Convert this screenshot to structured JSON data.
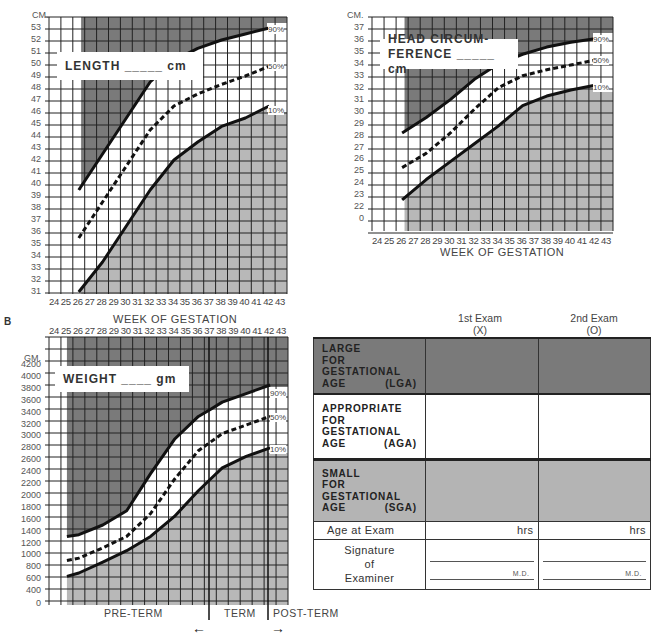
{
  "section_labels": {
    "b": "B"
  },
  "length_chart": {
    "unit_label": "CM.",
    "title_box": "LENGTH _____ cm",
    "xlabel": "WEEK OF GESTATION",
    "y_ticks": [
      "53",
      "52",
      "51",
      "50",
      "49",
      "48",
      "47",
      "46",
      "45",
      "44",
      "43",
      "42",
      "41",
      "40",
      "39",
      "38",
      "37",
      "36",
      "35",
      "34",
      "33",
      "32",
      "31"
    ],
    "x_ticks": [
      "24",
      "25",
      "26",
      "27",
      "28",
      "29",
      "30",
      "31",
      "32",
      "33",
      "34",
      "35",
      "36",
      "37",
      "38",
      "39",
      "40",
      "41",
      "42",
      "43"
    ],
    "percentiles": [
      "90%",
      "50%",
      "10%"
    ]
  },
  "head_chart": {
    "unit_label": "CM.",
    "title_line1": "HEAD CIRCUM-",
    "title_line2": "FERENCE _____ cm",
    "xlabel": "WEEK OF GESTATION",
    "y_ticks": [
      "37",
      "36",
      "35",
      "34",
      "33",
      "32",
      "31",
      "30",
      "29",
      "28",
      "27",
      "26",
      "25",
      "24",
      "23",
      "22",
      "0"
    ],
    "x_ticks": [
      "24",
      "25",
      "26",
      "27",
      "28",
      "29",
      "30",
      "31",
      "32",
      "33",
      "34",
      "35",
      "36",
      "37",
      "38",
      "39",
      "40",
      "41",
      "42",
      "43"
    ],
    "percentiles": [
      "90%",
      "50%",
      "10%"
    ]
  },
  "weight_chart": {
    "unit_label": "GM.",
    "title_box": "WEIGHT ____ gm",
    "x_ticks": [
      "24",
      "25",
      "26",
      "27",
      "28",
      "29",
      "30",
      "31",
      "32",
      "33",
      "34",
      "35",
      "36",
      "37",
      "38",
      "39",
      "40",
      "41",
      "42",
      "43"
    ],
    "y_ticks": [
      "4200",
      "4000",
      "3800",
      "3600",
      "3400",
      "3200",
      "3000",
      "2800",
      "2600",
      "2400",
      "2200",
      "2000",
      "1800",
      "1600",
      "1400",
      "1200",
      "1000",
      "800",
      "600",
      "400",
      "0"
    ],
    "percentiles": [
      "90%",
      "50%",
      "10%"
    ],
    "periods": {
      "pre_term": "PRE-TERM",
      "term": "TERM",
      "post_term": "POST-TERM"
    },
    "arrows": {
      "left": "←",
      "right": "→"
    }
  },
  "classification_table": {
    "col_headers": [
      {
        "line1": "1st Exam",
        "line2": "(X)"
      },
      {
        "line1": "2nd Exam",
        "line2": "(O)"
      }
    ],
    "rows": [
      {
        "lines": [
          "LARGE",
          "FOR",
          "GESTATIONAL"
        ],
        "last": "AGE",
        "abbr": "(LGA)",
        "color": "#7a7a7a"
      },
      {
        "lines": [
          "APPROPRIATE",
          "FOR",
          "GESTATIONAL"
        ],
        "last": "AGE",
        "abbr": "(AGA)",
        "color": "#ffffff"
      },
      {
        "lines": [
          "SMALL",
          "FOR",
          "GESTATIONAL"
        ],
        "last": "AGE",
        "abbr": "(SGA)",
        "color": "#b4b4b4"
      }
    ],
    "age_row": {
      "label": "Age at Exam",
      "unit1": "hrs",
      "unit2": "hrs"
    },
    "signature_row": {
      "label_line1": "Signature",
      "label_line2": "of",
      "label_line3": "Examiner",
      "suffix1": "M.D.",
      "suffix2": "M.D."
    }
  },
  "chart_data": [
    {
      "type": "line",
      "title": "LENGTH cm",
      "xlabel": "WEEK OF GESTATION",
      "ylabel": "CM.",
      "xlim": [
        24,
        43
      ],
      "ylim": [
        31,
        53
      ],
      "grid": true,
      "x": [
        26,
        28,
        30,
        32,
        34,
        36,
        38,
        40,
        42
      ],
      "series": [
        {
          "name": "90%",
          "values": [
            39.5,
            42.5,
            45.5,
            48.5,
            50.3,
            51.3,
            52.0,
            52.5,
            53.0
          ]
        },
        {
          "name": "50%",
          "values": [
            35.5,
            38.5,
            41.5,
            44.5,
            46.5,
            47.5,
            48.3,
            49.0,
            49.8
          ]
        },
        {
          "name": "10%",
          "values": [
            31.0,
            33.5,
            36.5,
            39.5,
            42.0,
            43.5,
            44.8,
            45.5,
            46.5
          ]
        }
      ]
    },
    {
      "type": "line",
      "title": "HEAD CIRCUMFERENCE cm",
      "xlabel": "WEEK OF GESTATION",
      "ylabel": "CM.",
      "xlim": [
        24,
        43
      ],
      "ylim": [
        22,
        37
      ],
      "grid": true,
      "x": [
        26,
        28,
        30,
        32,
        34,
        36,
        38,
        40,
        42
      ],
      "series": [
        {
          "name": "90%",
          "values": [
            28.2,
            29.5,
            31.0,
            32.7,
            34.0,
            34.8,
            35.4,
            35.8,
            36.1
          ]
        },
        {
          "name": "50%",
          "values": [
            25.3,
            26.5,
            28.2,
            30.2,
            32.0,
            33.0,
            33.5,
            33.9,
            34.3
          ]
        },
        {
          "name": "10%",
          "values": [
            22.6,
            24.3,
            25.8,
            27.3,
            28.8,
            30.5,
            31.3,
            31.8,
            32.2
          ]
        }
      ]
    },
    {
      "type": "line",
      "title": "WEIGHT gm",
      "xlabel": "WEEK OF GESTATION",
      "ylabel": "GM.",
      "xlim": [
        24,
        43
      ],
      "ylim": [
        0,
        4200
      ],
      "grid": true,
      "annotations": [
        "PRE-TERM",
        "TERM",
        "POST-TERM"
      ],
      "x": [
        25,
        26,
        28,
        30,
        32,
        34,
        36,
        37,
        38,
        40,
        42
      ],
      "series": [
        {
          "name": "90%",
          "values": [
            1200,
            1230,
            1400,
            1650,
            2300,
            2900,
            3300,
            3420,
            3550,
            3700,
            3850
          ]
        },
        {
          "name": "50%",
          "values": [
            780,
            820,
            1000,
            1200,
            1600,
            2200,
            2700,
            2850,
            3000,
            3150,
            3300
          ]
        },
        {
          "name": "10%",
          "values": [
            500,
            560,
            750,
            950,
            1200,
            1550,
            2000,
            2200,
            2400,
            2600,
            2750
          ]
        }
      ]
    }
  ]
}
